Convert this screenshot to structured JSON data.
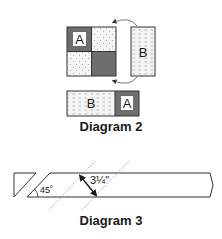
{
  "diagram2": {
    "caption": "Diagram 2",
    "grid_block": {
      "cells": [
        {
          "position": "top-left",
          "fill": "dark",
          "label": "A"
        },
        {
          "position": "top-right",
          "fill": "dotted",
          "label": ""
        },
        {
          "position": "bottom-left",
          "fill": "dotted",
          "label": ""
        },
        {
          "position": "bottom-right",
          "fill": "dark",
          "label": ""
        }
      ]
    },
    "side_panel": {
      "fill": "dashed",
      "label": "B"
    },
    "rotation_arrows": [
      "top-curved-arrow",
      "bottom-curved-arrow"
    ],
    "strip": {
      "segments": [
        {
          "fill": "dashed",
          "label": "B"
        },
        {
          "fill": "dark",
          "label": "A"
        }
      ]
    }
  },
  "diagram3": {
    "caption": "Diagram 3",
    "angle_label": "45˚",
    "measurement": "3¼\"",
    "measurement_whole": "3",
    "measurement_fraction": "¼",
    "measurement_unit": "\""
  },
  "colors": {
    "dark_fill": "#6e6e6e",
    "light_fill": "#f2f2f2",
    "stroke": "#333333",
    "dotted_guide": "#888888"
  }
}
